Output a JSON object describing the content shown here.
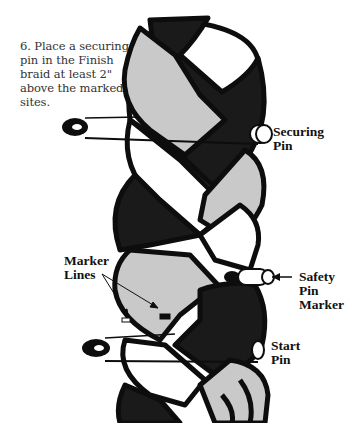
{
  "instruction": {
    "step_number": "6.",
    "lines": [
      "6. Place a securing",
      "pin in the Finish",
      "braid at least 2\"",
      "above the marked",
      "sites."
    ]
  },
  "labels": {
    "securing_pin": [
      "Securing",
      "Pin"
    ],
    "safety_pin_marker": [
      "Safety",
      "Pin",
      "Marker"
    ],
    "marker_lines": [
      "Marker",
      "Lines"
    ],
    "start_pin": [
      "Start",
      "Pin"
    ]
  },
  "colors": {
    "background": "#ffffff",
    "outline": "#0d0d0d",
    "dark_strand": "#1a1a1a",
    "light_strand": "#c9c9c9",
    "white_strand": "#ffffff",
    "text": "#111111"
  },
  "icons": [
    "safety-pin-icon",
    "arrow-left-icon",
    "arrow-icon"
  ]
}
